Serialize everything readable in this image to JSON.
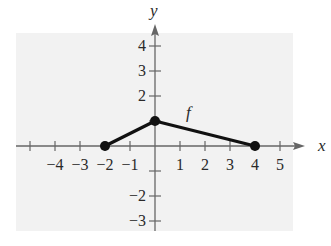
{
  "chart_data": {
    "type": "line",
    "title": "",
    "xlabel": "x",
    "ylabel": "y",
    "series": [
      {
        "name": "f",
        "points": [
          [
            -2,
            0
          ],
          [
            0,
            1
          ],
          [
            4,
            0
          ]
        ],
        "markers": true
      }
    ],
    "function_label": "f",
    "xlim": [
      -5,
      5
    ],
    "ylim": [
      -3,
      4
    ],
    "x_ticks": [
      -5,
      -4,
      -3,
      -2,
      -1,
      1,
      2,
      3,
      4,
      5
    ],
    "x_tick_labels": [
      "-4",
      "-3",
      "-2",
      "-1",
      "1",
      "2",
      "3",
      "4",
      "5"
    ],
    "y_ticks": [
      -3,
      -2,
      -1,
      1,
      2,
      3,
      4
    ],
    "y_tick_labels": [
      "4",
      "3",
      "2",
      "-2",
      "-3"
    ],
    "grid": false,
    "background_color": "#f2f2f2",
    "line_color": "#111111",
    "axis_color": "#666666"
  },
  "labels": {
    "x_axis": "x",
    "y_axis": "y",
    "function": "f"
  }
}
